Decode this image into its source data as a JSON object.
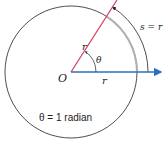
{
  "diagram": {
    "colors": {
      "circle": "#222222",
      "terminal_ray": "#d63a5a",
      "initial_ray": "#2f6fbf",
      "arc_inner": "#b0b0b0",
      "arc_outer": "#222222"
    },
    "labels": {
      "origin": "O",
      "radius_top": "r",
      "radius_bottom": "r",
      "angle": "θ",
      "arc_length": "s = r",
      "caption": "θ = 1 radian"
    }
  }
}
